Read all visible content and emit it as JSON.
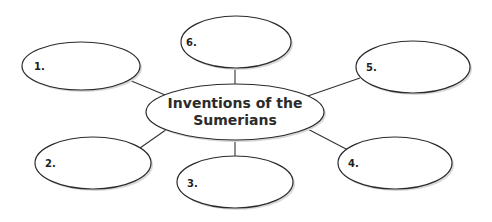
{
  "diagram": {
    "type": "idea web / graphic organizer",
    "center": {
      "line1": "Inventions of the",
      "line2": "Sumerians"
    },
    "nodes": [
      {
        "label": "1.",
        "value": ""
      },
      {
        "label": "2.",
        "value": ""
      },
      {
        "label": "3.",
        "value": ""
      },
      {
        "label": "4.",
        "value": ""
      },
      {
        "label": "5.",
        "value": ""
      },
      {
        "label": "6.",
        "value": ""
      }
    ],
    "colors": {
      "stroke": "#2a2a2a",
      "fill": "#ffffff",
      "text": "#2b2b2b"
    }
  }
}
